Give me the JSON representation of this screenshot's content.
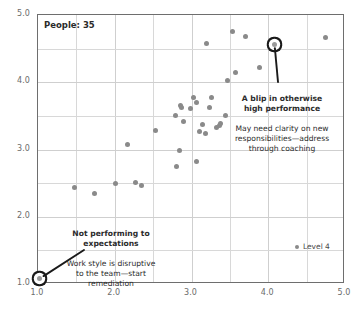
{
  "chart_data": {
    "type": "scatter",
    "title": "",
    "subtitle": "",
    "xlabel": "",
    "ylabel": "",
    "xlim": [
      1.0,
      5.0
    ],
    "ylim": [
      1.0,
      5.0
    ],
    "grid": true,
    "grid_step": 0.5,
    "xticks": [
      "1.0",
      "2.0",
      "3.0",
      "4.0",
      "5.0"
    ],
    "yticks": [
      "1.0",
      "2.0",
      "3.0",
      "4.0",
      "5.0"
    ],
    "xtick_values": [
      1.0,
      2.0,
      3.0,
      4.0,
      5.0
    ],
    "ytick_values": [
      1.0,
      2.0,
      3.0,
      4.0,
      5.0
    ],
    "legend_position": "inside-bottom-right",
    "series": [
      {
        "name": "Level 4",
        "color": "#8a8a8a",
        "points": [
          {
            "x": 1.02,
            "y": 1.08,
            "highlight": true
          },
          {
            "x": 1.47,
            "y": 2.43,
            "highlight": false
          },
          {
            "x": 1.73,
            "y": 2.34,
            "highlight": false
          },
          {
            "x": 2.01,
            "y": 2.49,
            "highlight": false
          },
          {
            "x": 2.17,
            "y": 3.08,
            "highlight": false
          },
          {
            "x": 2.27,
            "y": 2.51,
            "highlight": false
          },
          {
            "x": 2.35,
            "y": 2.47,
            "highlight": false
          },
          {
            "x": 2.53,
            "y": 3.28,
            "highlight": false
          },
          {
            "x": 2.79,
            "y": 3.5,
            "highlight": false
          },
          {
            "x": 2.8,
            "y": 2.74,
            "highlight": false
          },
          {
            "x": 2.84,
            "y": 2.98,
            "highlight": false
          },
          {
            "x": 2.86,
            "y": 3.65,
            "highlight": false
          },
          {
            "x": 2.87,
            "y": 3.63,
            "highlight": false
          },
          {
            "x": 2.89,
            "y": 3.41,
            "highlight": false
          },
          {
            "x": 2.99,
            "y": 3.61,
            "highlight": false
          },
          {
            "x": 3.02,
            "y": 3.78,
            "highlight": false
          },
          {
            "x": 3.06,
            "y": 3.7,
            "highlight": false
          },
          {
            "x": 3.07,
            "y": 2.82,
            "highlight": false
          },
          {
            "x": 3.1,
            "y": 3.27,
            "highlight": false
          },
          {
            "x": 3.14,
            "y": 3.37,
            "highlight": false
          },
          {
            "x": 3.18,
            "y": 3.24,
            "highlight": false
          },
          {
            "x": 3.2,
            "y": 4.58,
            "highlight": false
          },
          {
            "x": 3.23,
            "y": 3.63,
            "highlight": false
          },
          {
            "x": 3.26,
            "y": 3.78,
            "highlight": false
          },
          {
            "x": 3.33,
            "y": 3.33,
            "highlight": false
          },
          {
            "x": 3.36,
            "y": 3.36,
            "highlight": false
          },
          {
            "x": 3.38,
            "y": 3.38,
            "highlight": false
          },
          {
            "x": 3.44,
            "y": 3.5,
            "highlight": false
          },
          {
            "x": 3.47,
            "y": 4.03,
            "highlight": false
          },
          {
            "x": 3.54,
            "y": 4.75,
            "highlight": false
          },
          {
            "x": 3.57,
            "y": 4.14,
            "highlight": false
          },
          {
            "x": 3.7,
            "y": 4.68,
            "highlight": false
          },
          {
            "x": 3.89,
            "y": 4.22,
            "highlight": false
          },
          {
            "x": 4.08,
            "y": 4.56,
            "highlight": true
          },
          {
            "x": 4.75,
            "y": 4.67,
            "highlight": false
          }
        ]
      }
    ],
    "annotations": [
      {
        "id": "high-performer-blip",
        "headline": "A blip in otherwise\nhigh performance",
        "body": "May need clarity on new\nresponsibilities—address\nthrough coaching",
        "target_point": {
          "x": 4.08,
          "y": 4.56
        }
      },
      {
        "id": "underperformer",
        "headline": "Not performing to\nexpectations",
        "body": "Work style is disruptive\nto the team—start\nremediation",
        "target_point": {
          "x": 1.02,
          "y": 1.08
        }
      }
    ]
  },
  "overlay": {
    "people_count_label": "People: 35"
  },
  "legend": {
    "entries": [
      {
        "label": "Level 4",
        "color": "#8a8a8a"
      }
    ]
  },
  "colors": {
    "point": "#8a8a8a",
    "highlight_ring": "#1a1a1a",
    "gridline": "#d8d8d8",
    "frame": "#6e6e6e",
    "text": "#2b2b2b",
    "tick_text": "#6b6b6b"
  }
}
